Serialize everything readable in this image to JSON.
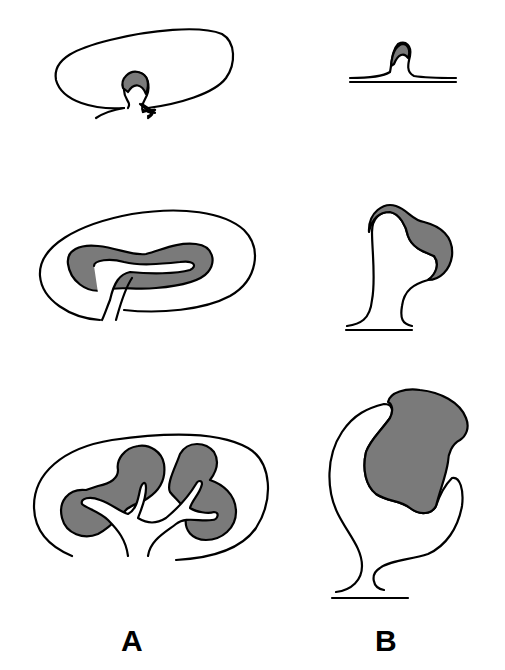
{
  "diagram": {
    "columns": [
      {
        "label": "A",
        "stages": [
          "stage-1",
          "stage-2",
          "stage-3"
        ]
      },
      {
        "label": "B",
        "stages": [
          "stage-1",
          "stage-2",
          "stage-3"
        ]
      }
    ],
    "colors": {
      "outline": "#000000",
      "shaded": "#7a7a7a",
      "background": "#ffffff"
    }
  }
}
